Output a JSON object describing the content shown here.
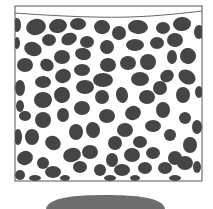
{
  "figure": {
    "colors": {
      "background": "#ffffff",
      "frame": "#555555",
      "pebble": "#454545",
      "mound": "#6e6e6e"
    },
    "frame": {
      "x": 15,
      "y": 6,
      "w": 187,
      "h": 175
    },
    "water_line": "M15,13 C55,16 100,18 130,17 C160,16 185,13 202,11",
    "mound": {
      "cx": 105,
      "top": 195,
      "x1": 46,
      "x2": 165,
      "bottom": 209
    },
    "pebbles": [
      [
        17,
        25,
        4,
        7,
        0
      ],
      [
        36,
        27,
        10,
        8,
        -15
      ],
      [
        58,
        26,
        9,
        7,
        -10
      ],
      [
        78,
        24,
        8,
        6,
        0
      ],
      [
        102,
        27,
        8,
        7,
        10
      ],
      [
        119,
        33,
        7,
        7,
        0
      ],
      [
        138,
        27,
        10,
        7,
        5
      ],
      [
        163,
        28,
        7,
        6,
        0
      ],
      [
        182,
        24,
        9,
        7,
        -5
      ],
      [
        199,
        32,
        5,
        7,
        0
      ],
      [
        17,
        43,
        3,
        6,
        0
      ],
      [
        49,
        40,
        7,
        6,
        0
      ],
      [
        69,
        39,
        8,
        6,
        -20
      ],
      [
        87,
        42,
        7,
        6,
        0
      ],
      [
        33,
        49,
        9,
        7,
        20
      ],
      [
        107,
        47,
        7,
        7,
        -30
      ],
      [
        135,
        45,
        9,
        6,
        0
      ],
      [
        157,
        43,
        7,
        6,
        0
      ],
      [
        175,
        40,
        8,
        7,
        0
      ],
      [
        25,
        65,
        8,
        7,
        0
      ],
      [
        47,
        65,
        7,
        6,
        30
      ],
      [
        62,
        57,
        8,
        7,
        0
      ],
      [
        83,
        54,
        8,
        6,
        10
      ],
      [
        108,
        65,
        8,
        7,
        0
      ],
      [
        128,
        63,
        8,
        7,
        0
      ],
      [
        148,
        62,
        8,
        8,
        0
      ],
      [
        172,
        57,
        5,
        7,
        0
      ],
      [
        188,
        56,
        8,
        8,
        -10
      ],
      [
        20,
        88,
        5,
        8,
        0
      ],
      [
        43,
        82,
        8,
        6,
        0
      ],
      [
        63,
        76,
        8,
        7,
        -20
      ],
      [
        82,
        70,
        8,
        6,
        0
      ],
      [
        103,
        80,
        10,
        7,
        0
      ],
      [
        140,
        79,
        9,
        7,
        0
      ],
      [
        167,
        76,
        7,
        6,
        -30
      ],
      [
        187,
        77,
        9,
        7,
        30
      ],
      [
        43,
        100,
        9,
        8,
        0
      ],
      [
        62,
        95,
        8,
        8,
        10
      ],
      [
        85,
        87,
        9,
        7,
        0
      ],
      [
        102,
        97,
        7,
        7,
        0
      ],
      [
        122,
        95,
        6,
        8,
        -10
      ],
      [
        147,
        97,
        8,
        7,
        0
      ],
      [
        160,
        88,
        7,
        7,
        0
      ],
      [
        183,
        95,
        7,
        8,
        0
      ],
      [
        199,
        92,
        4,
        6,
        0
      ],
      [
        20,
        106,
        4,
        6,
        0
      ],
      [
        25,
        116,
        6,
        5,
        0
      ],
      [
        43,
        120,
        8,
        8,
        0
      ],
      [
        63,
        115,
        6,
        7,
        0
      ],
      [
        82,
        108,
        8,
        7,
        0
      ],
      [
        107,
        116,
        8,
        7,
        0
      ],
      [
        133,
        113,
        8,
        7,
        -20
      ],
      [
        163,
        110,
        7,
        8,
        0
      ],
      [
        185,
        118,
        6,
        6,
        0
      ],
      [
        18,
        137,
        4,
        8,
        0
      ],
      [
        32,
        137,
        7,
        8,
        0
      ],
      [
        53,
        143,
        8,
        7,
        30
      ],
      [
        76,
        132,
        7,
        8,
        0
      ],
      [
        93,
        130,
        7,
        8,
        -10
      ],
      [
        115,
        143,
        7,
        7,
        0
      ],
      [
        125,
        130,
        8,
        7,
        0
      ],
      [
        140,
        142,
        7,
        6,
        0
      ],
      [
        153,
        126,
        8,
        6,
        0
      ],
      [
        170,
        135,
        6,
        6,
        0
      ],
      [
        190,
        145,
        7,
        8,
        0
      ],
      [
        197,
        127,
        5,
        7,
        0
      ],
      [
        25,
        158,
        8,
        7,
        -20
      ],
      [
        43,
        163,
        6,
        6,
        0
      ],
      [
        72,
        155,
        9,
        7,
        -15
      ],
      [
        90,
        152,
        8,
        7,
        0
      ],
      [
        112,
        160,
        6,
        7,
        0
      ],
      [
        132,
        155,
        8,
        7,
        0
      ],
      [
        153,
        153,
        7,
        6,
        0
      ],
      [
        175,
        158,
        7,
        7,
        0
      ],
      [
        20,
        175,
        5,
        5,
        0
      ],
      [
        53,
        172,
        8,
        6,
        0
      ],
      [
        80,
        167,
        7,
        6,
        0
      ],
      [
        100,
        170,
        6,
        6,
        0
      ],
      [
        122,
        170,
        8,
        6,
        0
      ],
      [
        145,
        168,
        7,
        6,
        0
      ],
      [
        165,
        168,
        7,
        6,
        0
      ],
      [
        185,
        163,
        8,
        7,
        0
      ],
      [
        197,
        167,
        4,
        6,
        0
      ],
      [
        35,
        178,
        6,
        3,
        0
      ],
      [
        65,
        178,
        5,
        3,
        0
      ],
      [
        110,
        178,
        6,
        3,
        0
      ],
      [
        135,
        178,
        5,
        3,
        0
      ],
      [
        175,
        178,
        6,
        3,
        0
      ]
    ]
  }
}
